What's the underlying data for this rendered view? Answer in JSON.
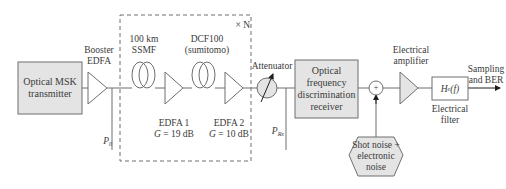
{
  "diagram": {
    "colors": {
      "stroke": "#6e6e6e",
      "box_fill": "#e4e4e4",
      "text": "#3a3a3a",
      "arrow": "#1f1f1f"
    },
    "blocks": {
      "transmitter": {
        "line1": "Optical MSK",
        "line2": "transmitter"
      },
      "booster": {
        "line1": "Booster",
        "line2": "EDFA"
      },
      "ssmf": {
        "line1": "100 km",
        "line2": "SSMF"
      },
      "dcf": {
        "line1": "DCF100",
        "line2": "(sumitomo)"
      },
      "edfa1": {
        "line1": "EDFA 1",
        "gain_var": "G",
        "gain_value": " = 19 dB"
      },
      "edfa2": {
        "line1": "EDFA 2",
        "gain_var": "G",
        "gain_value": " = 10 dB"
      },
      "span_repeat": "× N",
      "attenuator": "Attenuator",
      "receiver": {
        "line1": "Optical",
        "line2": "frequency",
        "line3": "discrimination",
        "line4": "receiver"
      },
      "summer": "+",
      "noise": {
        "line1": "Shot noise +",
        "line2": "electronic",
        "line3": "noise"
      },
      "amplifier": {
        "line1": "Electrical",
        "line2": "amplifier"
      },
      "filter": {
        "symbol": "H",
        "subscript": "e",
        "arg": "(f)",
        "line1": "Electrical",
        "line2": "filter"
      },
      "output": {
        "line1": "Sampling",
        "line2": "and BER"
      }
    },
    "taps": {
      "p0": {
        "symbol": "P",
        "subscript": "0"
      },
      "prx": {
        "symbol": "P",
        "subscript": "Rx"
      }
    }
  }
}
